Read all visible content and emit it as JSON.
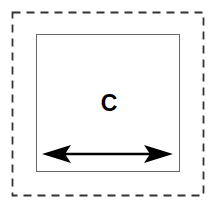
{
  "diagram": {
    "outer_box": {
      "style": "dashed",
      "color": "#333333"
    },
    "inner_box": {
      "style": "solid",
      "color": "#666666"
    },
    "label": "C",
    "arrow": {
      "type": "double-headed-horizontal",
      "color": "#000000"
    }
  }
}
